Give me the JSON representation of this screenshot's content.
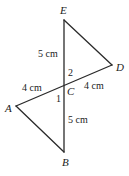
{
  "diagram": {
    "vertices": {
      "E": {
        "label": "E",
        "x": 64,
        "y": 20
      },
      "D": {
        "label": "D",
        "x": 112,
        "y": 65
      },
      "C": {
        "label": "C",
        "x": 64,
        "y": 87
      },
      "A": {
        "label": "A",
        "x": 16,
        "y": 106
      },
      "B": {
        "label": "B",
        "x": 64,
        "y": 152
      }
    },
    "segments": [
      {
        "from": "E",
        "to": "B"
      },
      {
        "from": "A",
        "to": "D"
      },
      {
        "from": "E",
        "to": "D"
      },
      {
        "from": "A",
        "to": "B"
      }
    ],
    "measurements": {
      "EC": "5 cm",
      "AC": "4 cm",
      "CD": "4 cm",
      "CB": "5 cm"
    },
    "angles": {
      "angle1": "1",
      "angle2": "2"
    }
  }
}
